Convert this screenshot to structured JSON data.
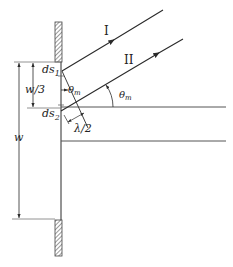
{
  "figure": {
    "colors": {
      "line": "#2a2a2a",
      "guide": "#777777",
      "hatch": "#555555",
      "background": "#ffffff"
    }
  },
  "labels": {
    "ray_1": "I",
    "ray_2": "II",
    "ds1_main": "ds",
    "ds1_sub": "1",
    "ds2_main": "ds",
    "ds2_sub": "2",
    "theta_inner_main": "θ",
    "theta_inner_sub": "m",
    "theta_outer_main": "θ",
    "theta_outer_sub": "m",
    "w_third": "w/3",
    "w": "w",
    "half_lambda": "λ/2"
  }
}
